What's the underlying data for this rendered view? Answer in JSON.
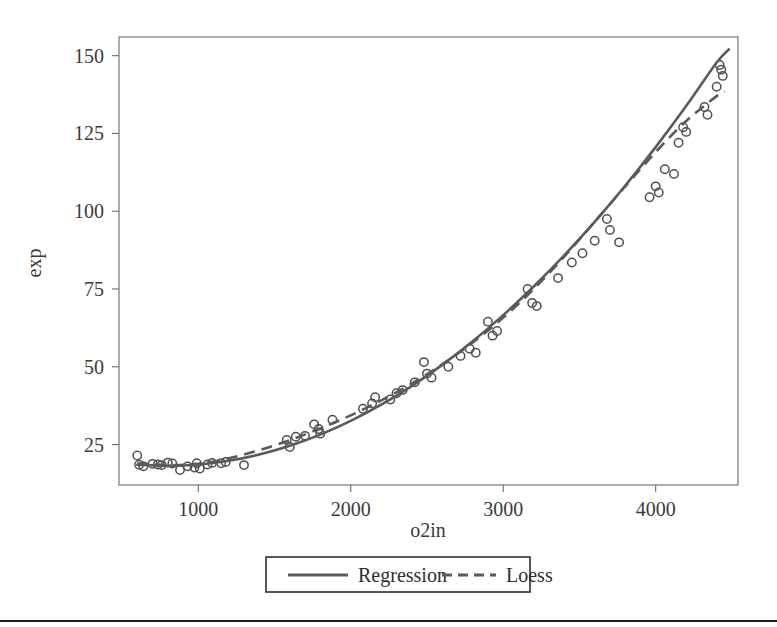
{
  "figure": {
    "background_color": "#ffffff",
    "frame_color": "#6b6b6b",
    "ink_color": "#5a5a5a",
    "marker_color": "#4f4f4f"
  },
  "axes": {
    "x_title": "o2in",
    "y_title": "exp",
    "x_ticks": [
      "1000",
      "2000",
      "3000",
      "4000"
    ],
    "y_ticks": [
      "25",
      "50",
      "75",
      "100",
      "125",
      "150"
    ]
  },
  "legend": {
    "position": "below-axis",
    "entries": [
      {
        "label": "Regression",
        "style": "solid",
        "icon": "solid-line-icon"
      },
      {
        "label": "Loess",
        "style": "dashed",
        "icon": "dashed-line-icon"
      }
    ]
  },
  "footer": {
    "rule_color": "#1a1a1a"
  },
  "chart_data": {
    "type": "scatter",
    "title": "",
    "subtitle": "",
    "xlabel": "o2in",
    "ylabel": "exp",
    "xlim": [
      480,
      4540
    ],
    "ylim": [
      12,
      156
    ],
    "xticks": [
      1000,
      2000,
      3000,
      4000
    ],
    "yticks": [
      25,
      50,
      75,
      100,
      125,
      150
    ],
    "grid": false,
    "legend_position": "bottom",
    "marker": "open-circle",
    "points": [
      {
        "x": 600,
        "y": 21.5
      },
      {
        "x": 612,
        "y": 18.5
      },
      {
        "x": 640,
        "y": 18.0
      },
      {
        "x": 700,
        "y": 18.8
      },
      {
        "x": 735,
        "y": 18.6
      },
      {
        "x": 760,
        "y": 18.4
      },
      {
        "x": 800,
        "y": 19.2
      },
      {
        "x": 830,
        "y": 18.9
      },
      {
        "x": 880,
        "y": 16.8
      },
      {
        "x": 930,
        "y": 18.0
      },
      {
        "x": 975,
        "y": 17.6
      },
      {
        "x": 990,
        "y": 19.0
      },
      {
        "x": 1010,
        "y": 17.3
      },
      {
        "x": 1060,
        "y": 18.6
      },
      {
        "x": 1090,
        "y": 19.1
      },
      {
        "x": 1150,
        "y": 19.0
      },
      {
        "x": 1180,
        "y": 19.4
      },
      {
        "x": 1300,
        "y": 18.4
      },
      {
        "x": 1580,
        "y": 26.5
      },
      {
        "x": 1600,
        "y": 24.2
      },
      {
        "x": 1640,
        "y": 27.5
      },
      {
        "x": 1700,
        "y": 27.8
      },
      {
        "x": 1760,
        "y": 31.5
      },
      {
        "x": 1790,
        "y": 30.0
      },
      {
        "x": 1800,
        "y": 28.5
      },
      {
        "x": 1880,
        "y": 33.0
      },
      {
        "x": 2080,
        "y": 36.5
      },
      {
        "x": 2140,
        "y": 38.2
      },
      {
        "x": 2160,
        "y": 40.2
      },
      {
        "x": 2260,
        "y": 39.5
      },
      {
        "x": 2300,
        "y": 41.5
      },
      {
        "x": 2340,
        "y": 42.5
      },
      {
        "x": 2420,
        "y": 45.0
      },
      {
        "x": 2480,
        "y": 51.5
      },
      {
        "x": 2500,
        "y": 47.8
      },
      {
        "x": 2530,
        "y": 46.5
      },
      {
        "x": 2640,
        "y": 50.0
      },
      {
        "x": 2720,
        "y": 53.5
      },
      {
        "x": 2780,
        "y": 55.8
      },
      {
        "x": 2820,
        "y": 54.5
      },
      {
        "x": 2900,
        "y": 64.5
      },
      {
        "x": 2930,
        "y": 60.0
      },
      {
        "x": 2960,
        "y": 61.5
      },
      {
        "x": 3160,
        "y": 75.0
      },
      {
        "x": 3190,
        "y": 70.5
      },
      {
        "x": 3220,
        "y": 69.5
      },
      {
        "x": 3360,
        "y": 78.5
      },
      {
        "x": 3450,
        "y": 83.5
      },
      {
        "x": 3520,
        "y": 86.5
      },
      {
        "x": 3600,
        "y": 90.5
      },
      {
        "x": 3680,
        "y": 97.5
      },
      {
        "x": 3700,
        "y": 94.0
      },
      {
        "x": 3760,
        "y": 90.0
      },
      {
        "x": 3960,
        "y": 104.5
      },
      {
        "x": 4000,
        "y": 108.0
      },
      {
        "x": 4020,
        "y": 106.0
      },
      {
        "x": 4060,
        "y": 113.5
      },
      {
        "x": 4120,
        "y": 112.0
      },
      {
        "x": 4150,
        "y": 122.0
      },
      {
        "x": 4180,
        "y": 127.0
      },
      {
        "x": 4200,
        "y": 125.5
      },
      {
        "x": 4320,
        "y": 133.5
      },
      {
        "x": 4340,
        "y": 131.0
      },
      {
        "x": 4400,
        "y": 140.0
      },
      {
        "x": 4420,
        "y": 147.0
      },
      {
        "x": 4430,
        "y": 145.5
      },
      {
        "x": 4440,
        "y": 143.5
      }
    ],
    "series": [
      {
        "name": "Regression",
        "style": "solid",
        "x": [
          600,
          800,
          1000,
          1200,
          1400,
          1600,
          1800,
          2000,
          2200,
          2400,
          2600,
          2800,
          3000,
          3200,
          3400,
          3600,
          3800,
          4000,
          4200,
          4400,
          4480
        ],
        "values": [
          18.5,
          18.2,
          18.6,
          19.8,
          21.8,
          24.6,
          28.2,
          32.6,
          37.8,
          43.8,
          50.6,
          58.2,
          66.6,
          75.8,
          85.8,
          96.6,
          108.2,
          120.6,
          133.8,
          147.8,
          152.0
        ]
      },
      {
        "name": "Loess",
        "style": "dashed",
        "x": [
          600,
          800,
          1000,
          1200,
          1400,
          1600,
          1800,
          2000,
          2200,
          2400,
          2600,
          2800,
          3000,
          3200,
          3400,
          3600,
          3800,
          4000,
          4200,
          4400,
          4450
        ],
        "values": [
          19.0,
          18.4,
          18.8,
          20.6,
          23.2,
          26.4,
          30.2,
          34.4,
          39.2,
          44.6,
          50.8,
          57.8,
          65.8,
          75.0,
          85.4,
          96.6,
          108.0,
          119.0,
          129.0,
          137.0,
          138.5
        ]
      }
    ]
  }
}
